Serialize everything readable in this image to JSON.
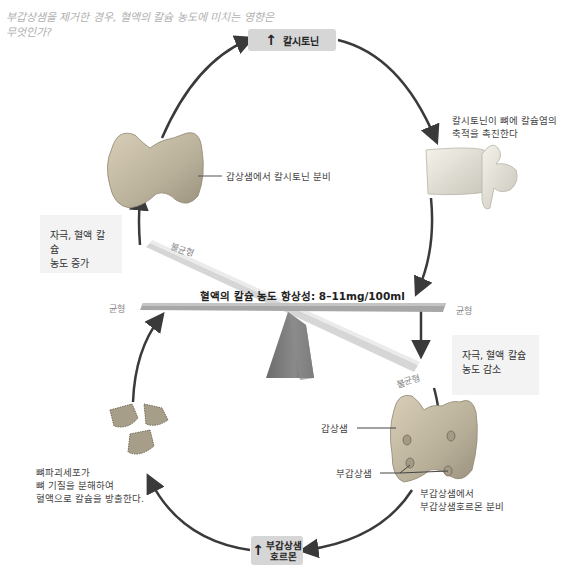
{
  "question": {
    "line1": "부갑상샘을 제거한 경우, 혈액의 칼슘 농도에 미치는 영향은",
    "line2": "무엇인가?"
  },
  "top_box": {
    "arrow": "↑",
    "label": "칼시토닌"
  },
  "bottom_box": {
    "arrow": "↑",
    "line1": "부갑상샘",
    "line2": "호르몬"
  },
  "thyroid_top_label": "갑상샘에서 칼시토닌 분비",
  "bone_label": {
    "line1": "칼시토닌이 뼈에 칼슘염의",
    "line2": "축적을 촉진한다"
  },
  "stimulus_increase": {
    "line1": "자극, 혈액 칼슘",
    "line2": "농도 증가"
  },
  "stimulus_decrease": {
    "line1": "자극, 혈액 칼슘",
    "line2": "농도 감소"
  },
  "seesaw": {
    "title": "혈액의 칼슘 농도 항상성: 8–11mg/100ml",
    "balance_left": "균형",
    "balance_right": "균형",
    "imbalance_top": "불균형",
    "imbalance_bottom": "불균형"
  },
  "thyroid_bottom": {
    "thyroid_label": "갑상샘",
    "parathyroid_label": "부갑상샘",
    "secretion_line1": "부갑상샘에서",
    "secretion_line2": "부갑상샘호르몬 분비"
  },
  "osteoclast_label": {
    "line1": "뼈파괴세포가",
    "line2": "뼈 기질을 분해하여",
    "line3": "혈액으로 칼슘을 방출한다."
  },
  "colors": {
    "arrow": "#3a3a3a",
    "box_fill": "#d6d6d6",
    "stim_fill": "#f3f3f3",
    "beam": "#9a9a9a",
    "pivot": "#777777",
    "question_text": "#b0b0b0"
  }
}
